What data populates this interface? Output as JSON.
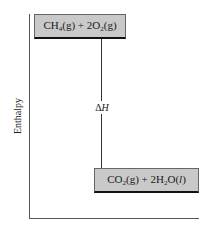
{
  "diagram": {
    "type": "enthalpy-level-diagram",
    "y_axis_label": "Enthalpy",
    "reactants": {
      "parts": [
        "CH",
        "4",
        "(g) + 2O",
        "2",
        "(g)"
      ],
      "text": "CH4(g) + 2O2(g)"
    },
    "products": {
      "parts": [
        "CO",
        "2",
        "(g) + 2H",
        "2",
        "O(",
        "l",
        ")"
      ],
      "text": "CO2(g) + 2H2O(l)"
    },
    "arrow": {
      "direction": "down",
      "label_symbol": "Δ",
      "label_var": "H",
      "label": "ΔH"
    },
    "colors": {
      "box_fill": "#c9c9c9",
      "box_border": "#111111",
      "axis": "#555555"
    }
  }
}
